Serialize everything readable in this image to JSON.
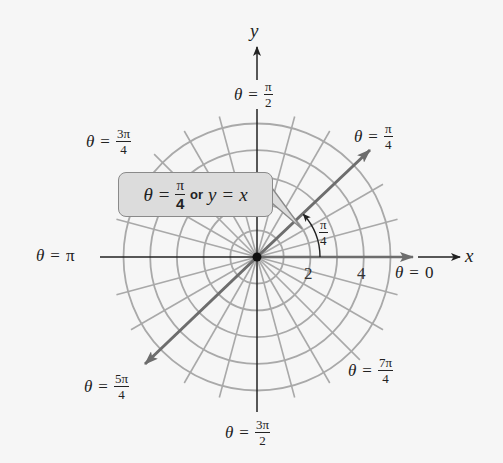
{
  "diagram": {
    "type": "polar-coordinate-grid",
    "center": {
      "x": 257,
      "y": 257
    },
    "unit_px": 26.7,
    "circle_radii_units": [
      1,
      2,
      3,
      4,
      5
    ],
    "radial_line_step_degrees": 15,
    "highlighted_ray": {
      "angle": "π/4",
      "equation_label": "θ = π/4 or y = x"
    },
    "colors": {
      "background": "#f6f6f6",
      "grid": "#a9a9a9",
      "axis": "#222222",
      "highlight_line": "#6d6d6d",
      "callout_fill": "#dcdcdc",
      "callout_border": "#8a8a8a"
    }
  },
  "axes": {
    "x_label": "x",
    "y_label": "y"
  },
  "ticks": {
    "two": "2",
    "four": "4"
  },
  "angle_labels": {
    "theta": "θ",
    "equals": "=",
    "zero": {
      "value": "0"
    },
    "pi_over_4": {
      "num": "π",
      "den": "4"
    },
    "pi_over_2": {
      "num": "π",
      "den": "2"
    },
    "three_pi_over_4": {
      "num": "3π",
      "den": "4"
    },
    "pi": {
      "value": "π"
    },
    "five_pi_over_4": {
      "num": "5π",
      "den": "4"
    },
    "three_pi_over_2": {
      "num": "3π",
      "den": "2"
    },
    "seven_pi_over_4": {
      "num": "7π",
      "den": "4"
    }
  },
  "angle_mark": {
    "num": "π",
    "den": "4"
  },
  "callout": {
    "theta": "θ",
    "equals": "=",
    "num": "π",
    "den": "4",
    "or": "or",
    "y": "y",
    "equals2": "=",
    "x": "x"
  }
}
